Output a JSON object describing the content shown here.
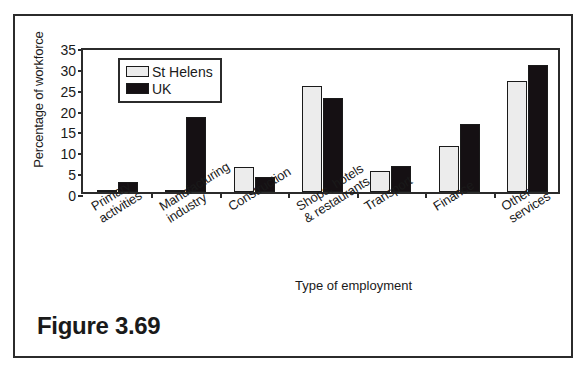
{
  "figure": {
    "caption": "Figure 3.69"
  },
  "chart_data": {
    "type": "bar",
    "title": "",
    "xlabel": "Type of employment",
    "ylabel": "Percentage of workforce",
    "ylim": [
      0,
      35
    ],
    "yticks": [
      0,
      5,
      10,
      15,
      20,
      25,
      30,
      35
    ],
    "grid": false,
    "legend_position": "top-left",
    "categories": [
      "Primary\nactivities",
      "Manufacturing\nindustry",
      "Construction",
      "Shops, hotels\n& restaurants",
      "Transport",
      "Finance",
      "Other\nservices"
    ],
    "series": [
      {
        "name": "St Helens",
        "color": "#ececec",
        "values": [
          0.5,
          0.2,
          6.0,
          25.5,
          5.0,
          11.0,
          26.7
        ]
      },
      {
        "name": "UK",
        "color": "#151013",
        "values": [
          2.5,
          18.1,
          3.5,
          22.5,
          6.3,
          16.3,
          30.4
        ]
      }
    ]
  }
}
